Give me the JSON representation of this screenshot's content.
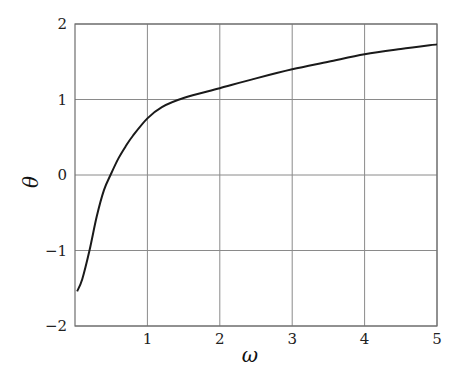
{
  "chart_data": {
    "type": "line",
    "title": "",
    "xlabel": "ω",
    "ylabel": "θ",
    "xlim": [
      0,
      5
    ],
    "ylim": [
      -2,
      2
    ],
    "xticks": [
      1,
      2,
      3,
      4,
      5
    ],
    "yticks": [
      -2,
      -1,
      0,
      1,
      2
    ],
    "xtick_labels": [
      "1",
      "2",
      "3",
      "4",
      "5"
    ],
    "ytick_labels": [
      "−2",
      "−1",
      "0",
      "1",
      "2"
    ],
    "grid": true,
    "legend": null,
    "series": [
      {
        "name": "θ(ω)",
        "color": "#1a1a1a",
        "x": [
          0.03,
          0.1,
          0.2,
          0.3,
          0.4,
          0.5,
          0.6,
          0.7,
          0.8,
          1.0,
          1.2,
          1.5,
          2.0,
          2.5,
          3.0,
          3.5,
          4.0,
          4.5,
          5.0
        ],
        "y": [
          -1.54,
          -1.38,
          -1.0,
          -0.55,
          -0.2,
          0.02,
          0.22,
          0.38,
          0.52,
          0.75,
          0.9,
          1.02,
          1.15,
          1.28,
          1.4,
          1.5,
          1.6,
          1.67,
          1.73
        ]
      }
    ]
  },
  "colors": {
    "grid": "#8a8a8a",
    "frame": "#6e6e6e",
    "line": "#1a1a1a"
  }
}
